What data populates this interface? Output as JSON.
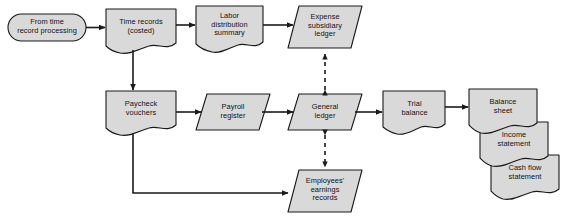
{
  "diagram": {
    "style": {
      "fill": "#d9d9d9",
      "stroke": "#1a1a1a",
      "background": "#ffffff",
      "text_color": "#111111"
    },
    "nodes": [
      {
        "id": "from-time-record-processing",
        "label": "From time\nrecord processing",
        "shape": "terminator",
        "x": 8,
        "y": 14,
        "w": 78,
        "h": 27
      },
      {
        "id": "time-records-costed",
        "label": "Time records\n(costed)",
        "shape": "document",
        "x": 106,
        "y": 9,
        "w": 70,
        "h": 41
      },
      {
        "id": "labor-distribution-summary",
        "label": "Labor\ndistribution\nsummary",
        "shape": "document",
        "x": 196,
        "y": 6,
        "w": 67,
        "h": 44
      },
      {
        "id": "expense-subsidiary-ledger",
        "label": "Expense\nsubsidiary\nledger",
        "shape": "parallelogram",
        "x": 288,
        "y": 6,
        "w": 74,
        "h": 42
      },
      {
        "id": "paycheck-vouchers",
        "label": "Paycheck\nvouchers",
        "shape": "document",
        "x": 106,
        "y": 91,
        "w": 70,
        "h": 41
      },
      {
        "id": "payroll-register",
        "label": "Payroll\nregister",
        "shape": "parallelogram",
        "x": 196,
        "y": 94,
        "w": 74,
        "h": 36
      },
      {
        "id": "general-ledger",
        "label": "General\nledger",
        "shape": "parallelogram",
        "x": 288,
        "y": 94,
        "w": 74,
        "h": 36
      },
      {
        "id": "trial-balance",
        "label": "Trial\nbalance",
        "shape": "document",
        "x": 383,
        "y": 91,
        "w": 62,
        "h": 41
      },
      {
        "id": "balance-sheet",
        "label": "Balance\nsheet",
        "shape": "document",
        "x": 469,
        "y": 89,
        "w": 68,
        "h": 40
      },
      {
        "id": "income-statement",
        "label": "Income\nstatement",
        "shape": "document",
        "x": 480,
        "y": 122,
        "w": 68,
        "h": 40
      },
      {
        "id": "cash-flow-statement",
        "label": "Cash flow\nstatement",
        "shape": "document",
        "x": 491,
        "y": 155,
        "w": 68,
        "h": 41
      },
      {
        "id": "employees-earnings-records",
        "label": "Employees'\nearnings\nrecords",
        "shape": "parallelogram",
        "x": 288,
        "y": 170,
        "w": 74,
        "h": 42
      }
    ],
    "connectors": [
      {
        "id": "from-time-to-time-records",
        "kind": "arrow-solid",
        "from": "from-time-record-processing",
        "to": "time-records-costed"
      },
      {
        "id": "time-records-to-labor-distribution",
        "kind": "arrow-solid",
        "from": "time-records-costed",
        "to": "labor-distribution-summary"
      },
      {
        "id": "labor-distribution-to-expense-ledger",
        "kind": "arrow-solid",
        "from": "labor-distribution-summary",
        "to": "expense-subsidiary-ledger"
      },
      {
        "id": "time-records-to-paycheck-vouchers",
        "kind": "arrow-solid",
        "from": "time-records-costed",
        "to": "paycheck-vouchers"
      },
      {
        "id": "paycheck-vouchers-to-payroll-register",
        "kind": "arrow-solid",
        "from": "paycheck-vouchers",
        "to": "payroll-register"
      },
      {
        "id": "payroll-register-to-general-ledger",
        "kind": "arrow-solid",
        "from": "payroll-register",
        "to": "general-ledger"
      },
      {
        "id": "general-ledger-to-trial-balance",
        "kind": "arrow-solid",
        "from": "general-ledger",
        "to": "trial-balance"
      },
      {
        "id": "trial-balance-to-balance-sheet",
        "kind": "arrow-solid",
        "from": "trial-balance",
        "to": "balance-sheet"
      },
      {
        "id": "paycheck-vouchers-to-employees-earnings",
        "kind": "arrow-solid-elbow",
        "from": "paycheck-vouchers",
        "to": "employees-earnings-records"
      },
      {
        "id": "general-ledger-expense-ledger-link",
        "kind": "arrow-dashed-double",
        "from": "general-ledger",
        "to": "expense-subsidiary-ledger"
      },
      {
        "id": "general-ledger-employees-earnings-link",
        "kind": "arrow-dashed-double",
        "from": "general-ledger",
        "to": "employees-earnings-records"
      }
    ]
  }
}
